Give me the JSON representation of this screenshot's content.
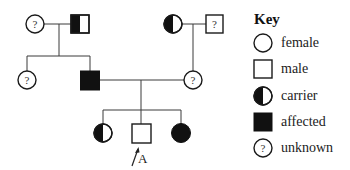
{
  "diagram": {
    "type": "pedigree",
    "generations": [
      {
        "id": "I",
        "individuals": [
          {
            "id": "I-1",
            "sex": "female",
            "status": "unknown",
            "symbol": "?"
          },
          {
            "id": "I-2",
            "sex": "male",
            "status": "carrier"
          },
          {
            "id": "I-3",
            "sex": "female",
            "status": "carrier"
          },
          {
            "id": "I-4",
            "sex": "male",
            "status": "unknown",
            "symbol": "?"
          }
        ]
      },
      {
        "id": "II",
        "individuals": [
          {
            "id": "II-1",
            "sex": "female",
            "status": "unknown",
            "symbol": "?",
            "parents": [
              "I-1",
              "I-2"
            ]
          },
          {
            "id": "II-2",
            "sex": "male",
            "status": "affected",
            "parents": [
              "I-1",
              "I-2"
            ]
          },
          {
            "id": "II-3",
            "sex": "female",
            "status": "unknown",
            "symbol": "?",
            "parents": [
              "I-3",
              "I-4"
            ]
          }
        ]
      },
      {
        "id": "III",
        "individuals": [
          {
            "id": "III-1",
            "sex": "female",
            "status": "carrier",
            "parents": [
              "II-2",
              "II-3"
            ]
          },
          {
            "id": "III-2",
            "sex": "male",
            "status": "unaffected",
            "proband": true,
            "parents": [
              "II-2",
              "II-3"
            ]
          },
          {
            "id": "III-3",
            "sex": "female",
            "status": "affected",
            "parents": [
              "II-2",
              "II-3"
            ]
          }
        ]
      }
    ],
    "unknown_symbol": "?",
    "proband_label": "A"
  },
  "key": {
    "title": "Key",
    "items": [
      {
        "symbol": "circle-icon",
        "label": "female"
      },
      {
        "symbol": "square-icon",
        "label": "male"
      },
      {
        "symbol": "half-filled-circle-icon",
        "label": "carrier"
      },
      {
        "symbol": "filled-square-icon",
        "label": "affected"
      },
      {
        "symbol": "question-circle-icon",
        "label": "unknown"
      }
    ]
  },
  "colors": {
    "line": "#3a3a3a",
    "fill": "#111111",
    "background": "#ffffff"
  }
}
